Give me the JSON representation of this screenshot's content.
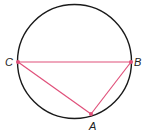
{
  "diagram": {
    "type": "inscribed-triangle",
    "circle": {
      "cx": 74.5,
      "cy": 61.5,
      "r": 57,
      "stroke": "#1a1a1a"
    },
    "line_color": "#e0507a",
    "points": {
      "A": {
        "x": 91,
        "y": 114,
        "label": "A",
        "lx": 89,
        "ly": 130
      },
      "B": {
        "x": 131,
        "y": 62,
        "label": "B",
        "lx": 134,
        "ly": 66
      },
      "C": {
        "x": 18,
        "y": 62,
        "label": "C",
        "lx": 5,
        "ly": 66
      }
    },
    "segments": [
      [
        "C",
        "B"
      ],
      [
        "C",
        "A"
      ],
      [
        "A",
        "B"
      ]
    ]
  }
}
